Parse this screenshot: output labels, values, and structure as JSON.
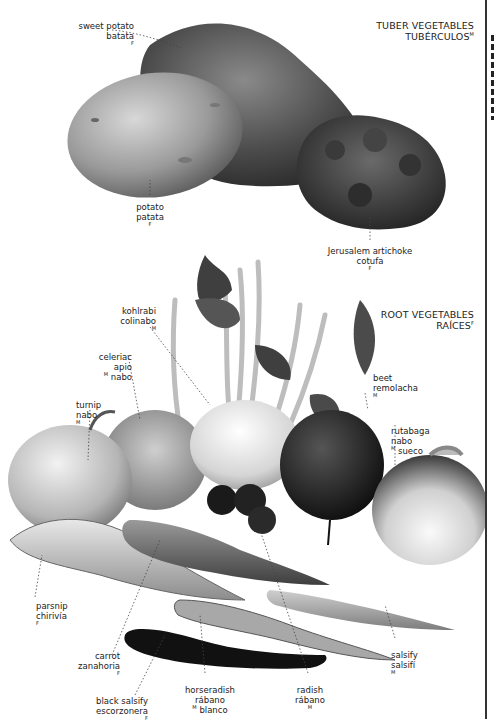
{
  "sections": {
    "tuber": {
      "title_en": "TUBER VEGETABLES",
      "title_es": "TUBÉRCULOS",
      "gender": "M"
    },
    "root": {
      "title_en": "ROOT VEGETABLES",
      "title_es": "RAÍCES",
      "gender": "F"
    }
  },
  "labels": [
    {
      "id": "sweet-potato",
      "en": "sweet potato",
      "es": "batata",
      "gender": "F"
    },
    {
      "id": "potato",
      "en": "potato",
      "es": "patata",
      "gender": "F"
    },
    {
      "id": "jerusalem-artichoke",
      "en": "Jerusalem artichoke",
      "es": "cotufa",
      "gender": "F"
    },
    {
      "id": "kohlrabi",
      "en": "kohlrabi",
      "es": "colinabo",
      "gender": "M"
    },
    {
      "id": "celeriac",
      "en": "celeriac",
      "es": "apio nabo",
      "es_pre": "apio",
      "es_post": " nabo",
      "gender": "M"
    },
    {
      "id": "turnip",
      "en": "turnip",
      "es": "nabo",
      "gender": "M"
    },
    {
      "id": "beet",
      "en": "beet",
      "es": "remolacha",
      "gender": "M"
    },
    {
      "id": "rutabaga",
      "en": "rutabaga",
      "es": "nabo sueco",
      "es_pre": "nabo",
      "es_post": " sueco",
      "gender": "M"
    },
    {
      "id": "parsnip",
      "en": "parsnip",
      "es": "chirivía",
      "gender": "F"
    },
    {
      "id": "carrot",
      "en": "carrot",
      "es": "zanahoria",
      "gender": "F"
    },
    {
      "id": "black-salsify",
      "en": "black salsify",
      "es": "escorzonera",
      "gender": "F"
    },
    {
      "id": "horseradish",
      "en": "horseradish",
      "es": "rábano blanco",
      "es_pre": "rábano",
      "es_post": " blanco",
      "gender": "M"
    },
    {
      "id": "radish",
      "en": "radish",
      "es": "rábano",
      "gender": "M"
    },
    {
      "id": "salsify",
      "en": "salsify",
      "es": "salsifí",
      "gender": "M"
    }
  ]
}
